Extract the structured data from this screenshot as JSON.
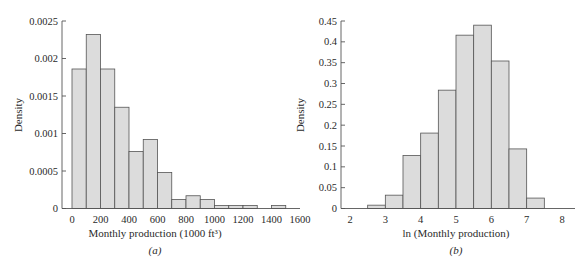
{
  "chart_data": [
    {
      "id": "a",
      "type": "bar",
      "subtype": "histogram",
      "title": "",
      "caption": "(a)",
      "xlabel": "Monthly production (1000 ft³)",
      "ylabel": "Density",
      "xlim": [
        -40,
        1600
      ],
      "ylim": [
        0,
        0.0025
      ],
      "xticks": [
        0,
        200,
        400,
        600,
        800,
        1000,
        1200,
        1400,
        1600
      ],
      "yticks": [
        0,
        0.0005,
        0.001,
        0.0015,
        0.002,
        0.0025
      ],
      "ytick_labels": [
        "0",
        "0.0005",
        "0.001",
        "0.0015",
        "0.002",
        "0.0025"
      ],
      "bin_width": 100,
      "bin_edges": [
        0,
        100,
        200,
        300,
        400,
        500,
        600,
        700,
        800,
        900,
        1000,
        1100,
        1200,
        1300,
        1400,
        1500
      ],
      "values": [
        0.00186,
        0.00232,
        0.00186,
        0.00135,
        0.00076,
        0.00092,
        0.00048,
        0.00012,
        0.00017,
        0.00012,
        4e-05,
        4e-05,
        4e-05,
        0,
        4e-05
      ],
      "grid": false,
      "legend": null
    },
    {
      "id": "b",
      "type": "bar",
      "subtype": "histogram",
      "title": "",
      "caption": "(b)",
      "xlabel": "ln (Monthly production)",
      "ylabel": "Density",
      "xlim": [
        1.75,
        8.3
      ],
      "ylim": [
        0,
        0.45
      ],
      "xticks": [
        2,
        3,
        4,
        5,
        6,
        7,
        8
      ],
      "yticks": [
        0,
        0.05,
        0.1,
        0.15,
        0.2,
        0.25,
        0.3,
        0.35,
        0.4,
        0.45
      ],
      "ytick_labels": [
        "0",
        "0.05",
        "0.1",
        "0.15",
        "0.2",
        "0.25",
        "0.3",
        "0.35",
        "0.4",
        "0.45"
      ],
      "bin_width": 0.5,
      "bin_edges": [
        2.5,
        3.0,
        3.5,
        4.0,
        4.5,
        5.0,
        5.5,
        6.0,
        6.5,
        7.0,
        7.5
      ],
      "values": [
        0.008,
        0.032,
        0.127,
        0.181,
        0.284,
        0.416,
        0.44,
        0.354,
        0.143,
        0.025
      ],
      "grid": false,
      "legend": null
    }
  ],
  "panels": {
    "a": {
      "ylabel": "Density",
      "xlabel": "Monthly production (1000 ft³)",
      "caption": "(a)"
    },
    "b": {
      "ylabel": "Density",
      "xlabel": "ln (Monthly production)",
      "caption": "(b)"
    }
  },
  "colors": {
    "bar_fill": "#dcdcdc",
    "bar_stroke": "#555555",
    "axis": "#555555",
    "text": "#2a2a2a"
  }
}
